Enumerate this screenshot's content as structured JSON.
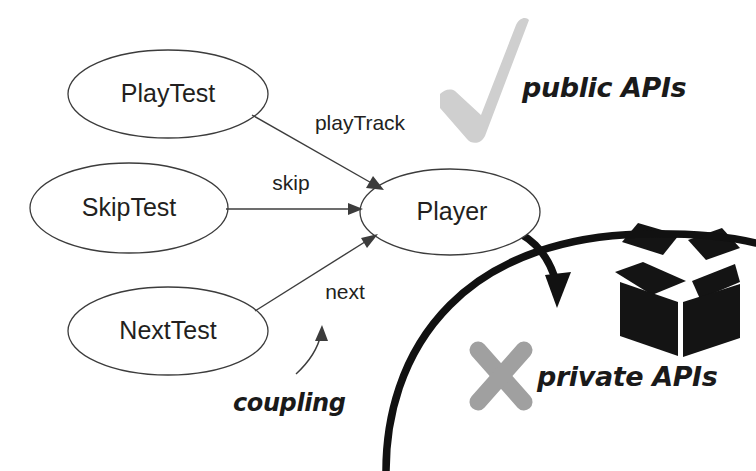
{
  "diagram": {
    "background_color": "#ffffff",
    "nodes": [
      {
        "id": "playtest",
        "label": "PlayTest",
        "cx": 168,
        "cy": 94,
        "rx": 100,
        "ry": 44
      },
      {
        "id": "skiptest",
        "label": "SkipTest",
        "cx": 129,
        "cy": 208,
        "rx": 99,
        "ry": 45
      },
      {
        "id": "nexttest",
        "label": "NextTest",
        "cx": 168,
        "cy": 331,
        "rx": 100,
        "ry": 44
      },
      {
        "id": "player",
        "label": "Player",
        "cx": 450,
        "cy": 212,
        "rx": 90,
        "ry": 43
      }
    ],
    "edges": [
      {
        "id": "playtrack",
        "label": "playTrack",
        "from": "playtest",
        "to": "player",
        "label_x": 360,
        "label_y": 124
      },
      {
        "id": "skip",
        "label": "skip",
        "from": "skiptest",
        "to": "player",
        "label_x": 291,
        "label_y": 184
      },
      {
        "id": "next",
        "label": "next",
        "from": "nexttest",
        "to": "player",
        "label_x": 345,
        "label_y": 293
      }
    ],
    "annotations": [
      {
        "id": "public-apis",
        "label": "public APIs",
        "x": 522,
        "y": 89,
        "color": "#1a1a1a"
      },
      {
        "id": "private-apis",
        "label": "private APIs",
        "x": 537,
        "y": 378,
        "color": "#1a1a1a"
      },
      {
        "id": "coupling",
        "label": "coupling",
        "x": 233,
        "y": 404,
        "color": "#1a1a1a"
      }
    ],
    "icons": [
      {
        "id": "check-icon",
        "name": "check-mark-icon",
        "meaning": "approved",
        "color": "#cfcfcf"
      },
      {
        "id": "x-icon",
        "name": "x-mark-icon",
        "meaning": "forbidden",
        "color": "#a0a0a0"
      },
      {
        "id": "open-box-icon",
        "name": "open-box-icon",
        "meaning": "package",
        "color": "#141414"
      }
    ],
    "boundary": {
      "id": "api-boundary",
      "name": "encapsulation-boundary-curve",
      "color": "#111111",
      "stroke_width": 7.5
    },
    "leak_arrow": {
      "id": "leak-arrow",
      "name": "private-api-leak-arrow",
      "color": "#111111"
    },
    "coupling_arrow": {
      "id": "coupling-pointer",
      "name": "coupling-pointer-arrow",
      "color": "#3c3c3c"
    }
  }
}
